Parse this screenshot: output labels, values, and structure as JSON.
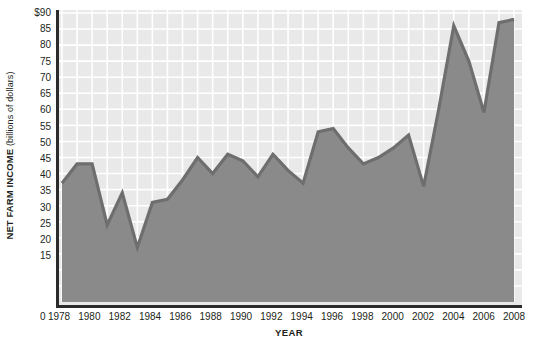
{
  "chart_data": {
    "type": "area",
    "title": "",
    "xlabel": "YEAR",
    "ylabel": "NET FARM INCOME",
    "ylabel_unit": "(billions of dollars)",
    "ylabel_full": "NET FARM INCOME (billions of dollars)",
    "xlim": [
      1978,
      2008
    ],
    "ylim": [
      0,
      90
    ],
    "y_ticks": [
      "$90",
      "85",
      "80",
      "75",
      "70",
      "65",
      "60",
      "55",
      "50",
      "45",
      "40",
      "35",
      "30",
      "25",
      "20",
      "15"
    ],
    "y_tick_values": [
      90,
      85,
      80,
      75,
      70,
      65,
      60,
      55,
      50,
      45,
      40,
      35,
      30,
      25,
      20,
      15
    ],
    "y_origin_label": "0",
    "x_ticks": [
      "1978",
      "1980",
      "1982",
      "1984",
      "1986",
      "1988",
      "1990",
      "1992",
      "1994",
      "1996",
      "1998",
      "2000",
      "2002",
      "2004",
      "2006",
      "2008"
    ],
    "x_tick_values": [
      1978,
      1980,
      1982,
      1984,
      1986,
      1988,
      1990,
      1992,
      1994,
      1996,
      1998,
      2000,
      2002,
      2004,
      2006,
      2008
    ],
    "x_minor_tick_step": 1,
    "grid": true,
    "grid_x_step": 1,
    "grid_y_step": 5,
    "legend": "none",
    "x": [
      1978,
      1979,
      1980,
      1981,
      1982,
      1983,
      1984,
      1985,
      1986,
      1987,
      1988,
      1989,
      1990,
      1991,
      1992,
      1993,
      1994,
      1995,
      1996,
      1997,
      1998,
      1999,
      2000,
      2001,
      2002,
      2003,
      2004,
      2005,
      2006,
      2007,
      2008
    ],
    "values": [
      37,
      43,
      43,
      24,
      34,
      17,
      31,
      32,
      38,
      45,
      40,
      46,
      44,
      39,
      46,
      41,
      37,
      53,
      54,
      48,
      43,
      45,
      48,
      52,
      36,
      60,
      86,
      75,
      59,
      87,
      88
    ],
    "series": [
      {
        "name": "Net farm income",
        "values": [
          37,
          43,
          43,
          24,
          34,
          17,
          31,
          32,
          38,
          45,
          40,
          46,
          44,
          39,
          46,
          41,
          37,
          53,
          54,
          48,
          43,
          45,
          48,
          52,
          36,
          60,
          86,
          75,
          59,
          87,
          88
        ]
      }
    ],
    "colors": {
      "fill": "#8a8a8a",
      "line": "#6e6e6e",
      "plot_background": "#e9e9e9",
      "gridline": "#ffffff",
      "axis": "#2b2b2b",
      "text": "#231f20"
    }
  }
}
